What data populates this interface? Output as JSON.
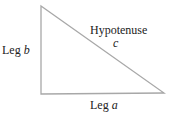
{
  "diagram": {
    "type": "right-triangle",
    "stroke_color": "#a8a8a8",
    "text_color": "#222222",
    "vertices": {
      "top": [
        41,
        6
      ],
      "right_angle": [
        41,
        94
      ],
      "bottom_right": [
        164,
        93
      ]
    },
    "labels": {
      "leg_b": {
        "prefix": "Leg ",
        "var": "b"
      },
      "leg_a": {
        "prefix": "Leg ",
        "var": "a"
      },
      "hypotenuse": {
        "word": "Hypotenuse",
        "var": "c"
      }
    }
  }
}
